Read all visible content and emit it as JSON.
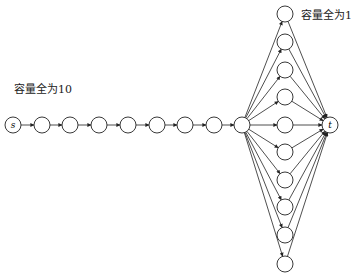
{
  "labels": {
    "chain_capacity": "容量全为10",
    "fan_capacity": "容量全为1"
  },
  "nodes": {
    "source": "s",
    "sink": "t"
  },
  "colors": {
    "stroke": "#222222",
    "fill": "#ffffff"
  },
  "layout": {
    "chain_y": 125,
    "chain_x": [
      13,
      42,
      70,
      99,
      128,
      157,
      185,
      214
    ],
    "hub": {
      "x": 242,
      "y": 125
    },
    "fan_x": 285,
    "fan_y": [
      14,
      42,
      70,
      97,
      125,
      152,
      180,
      207,
      235,
      264
    ],
    "sink": {
      "x": 330,
      "y": 125
    }
  }
}
